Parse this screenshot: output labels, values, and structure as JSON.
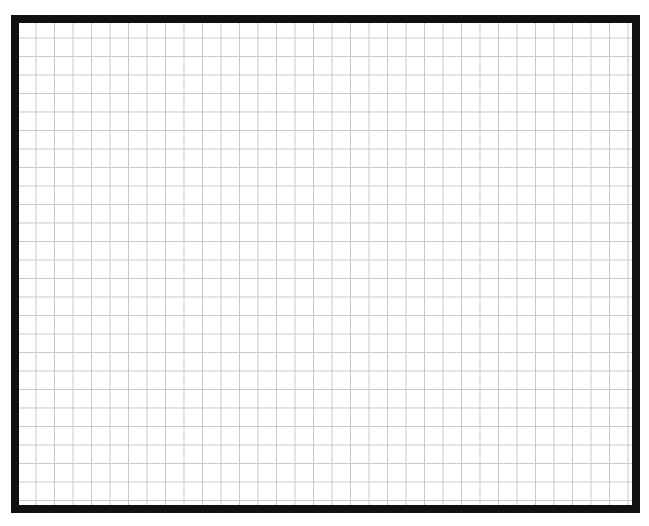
{
  "canvas": {
    "type": "grid-paper",
    "columns": 33,
    "rows": 26,
    "border_color": "#111111",
    "grid_color": "#c8c8c8",
    "background_color": "#ffffff"
  }
}
